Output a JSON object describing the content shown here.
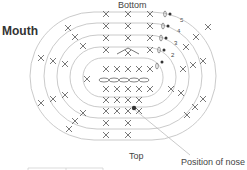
{
  "diagram": {
    "title": "Mouth",
    "labels": {
      "bottom": "Bottom",
      "top": "Top",
      "nose": "Position of nose"
    },
    "round_numbers": [
      "5",
      "4",
      "3",
      "2",
      "1"
    ],
    "colors": {
      "line": "#b5b5b5",
      "stitch": "#555555",
      "text": "#333333"
    },
    "stitch_symbols": {
      "single_crochet": "×",
      "chain": "oval",
      "slip_stitch_start": "•"
    }
  }
}
